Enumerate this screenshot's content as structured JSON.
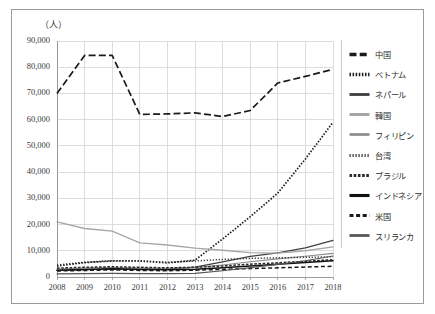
{
  "unit_label": "（人）",
  "axis": {
    "y_ticks": [
      "0",
      "10,000",
      "20,000",
      "30,000",
      "40,000",
      "50,000",
      "60,000",
      "70,000",
      "80,000",
      "90,000"
    ],
    "x_ticks": [
      "2008",
      "2009",
      "2010",
      "2011",
      "2012",
      "2013",
      "2014",
      "2015",
      "2016",
      "2017",
      "2018"
    ]
  },
  "legend": {
    "items": [
      {
        "label": "中国",
        "key": "dash-long-black"
      },
      {
        "label": "ベトナム",
        "key": "dotted-round-black"
      },
      {
        "label": "ネパール",
        "key": "solid-double-dark"
      },
      {
        "label": "韓国",
        "key": "solid-gray"
      },
      {
        "label": "フィリピン",
        "key": "zigzag-gray"
      },
      {
        "label": "台湾",
        "key": "dotted-sparse-black"
      },
      {
        "label": "ブラジル",
        "key": "dash-fine-black"
      },
      {
        "label": "インドネシア",
        "key": "solid-thick-black"
      },
      {
        "label": "米国",
        "key": "dash-square-black"
      },
      {
        "label": "スリランカ",
        "key": "solid-triple-dark"
      }
    ]
  },
  "chart_data": {
    "type": "line",
    "title": "",
    "xlabel": "",
    "ylabel": "（人）",
    "ylim": [
      0,
      90000
    ],
    "ytick_step": 10000,
    "grid": true,
    "legend_position": "right",
    "x": [
      2008,
      2009,
      2010,
      2011,
      2012,
      2013,
      2014,
      2015,
      2016,
      2017,
      2018
    ],
    "series": [
      {
        "name": "中国",
        "style": "dashed",
        "color": "#1a1a1a",
        "values": [
          70000,
          84500,
          84500,
          62000,
          62200,
          62600,
          61200,
          63500,
          74000,
          76500,
          79200
        ]
      },
      {
        "name": "ベトナム",
        "style": "dotted",
        "color": "#1a1a1a",
        "values": [
          4200,
          5500,
          6100,
          6100,
          5400,
          6400,
          14500,
          23000,
          32000,
          45000,
          59000
        ]
      },
      {
        "name": "ネパール",
        "style": "solid",
        "color": "#404040",
        "values": [
          2500,
          2800,
          3100,
          3000,
          3100,
          3800,
          5800,
          7900,
          9200,
          11100,
          14000
        ]
      },
      {
        "name": "韓国",
        "style": "solid",
        "color": "#a6a6a6",
        "values": [
          21000,
          18500,
          17500,
          13000,
          12200,
          11000,
          10200,
          9300,
          9100,
          10000,
          11500
        ]
      },
      {
        "name": "フィリピン",
        "style": "solid",
        "color": "#8c8c8c",
        "values": [
          3000,
          3400,
          3600,
          3400,
          3300,
          3600,
          4600,
          5800,
          6900,
          7900,
          9000
        ]
      },
      {
        "name": "台湾",
        "style": "dotted",
        "color": "#333333",
        "values": [
          4600,
          5600,
          6200,
          6200,
          5600,
          6100,
          6700,
          7100,
          7300,
          7500,
          7700
        ]
      },
      {
        "name": "ブラジル",
        "style": "dashed",
        "color": "#2a2a2a",
        "values": [
          3400,
          3700,
          3900,
          3700,
          3500,
          3700,
          4200,
          4900,
          5400,
          6000,
          6600
        ]
      },
      {
        "name": "インドネシア",
        "style": "solid",
        "color": "#111111",
        "values": [
          2600,
          2900,
          3100,
          2900,
          2800,
          3000,
          3500,
          4200,
          4900,
          5500,
          6200
        ]
      },
      {
        "name": "米国",
        "style": "dashed",
        "color": "#1a1a1a",
        "values": [
          2300,
          2500,
          2700,
          2500,
          2400,
          2600,
          2900,
          3200,
          3500,
          3800,
          4100
        ]
      },
      {
        "name": "スリランカ",
        "style": "solid",
        "color": "#555555",
        "values": [
          1200,
          1300,
          1400,
          1300,
          1300,
          1400,
          2400,
          3600,
          4800,
          6200,
          8000
        ]
      }
    ]
  }
}
